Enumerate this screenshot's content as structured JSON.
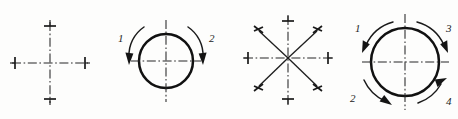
{
  "sheet": {
    "title": "Four mechanical motion-direction figures",
    "background_color": "#fdfdfc",
    "ink_color": "#1a1a1a",
    "width": 458,
    "height": 119,
    "figure_count": 4
  },
  "figures": [
    {
      "id": "figure-1",
      "name": "crosshair-axes",
      "type": "crosshair",
      "description": "Plain crossed centerlines with end ticks, no circle, no arrows",
      "center": {
        "x": 50,
        "y": 63
      },
      "horizontal_span": {
        "x1": 12,
        "x2": 88
      },
      "vertical_span": {
        "y1": 22,
        "y2": 103
      },
      "tick_count": 4,
      "arrow_count": 0,
      "arrows": []
    },
    {
      "id": "figure-2",
      "name": "circle-two-arrows",
      "type": "circle-with-arrows",
      "description": "Circle with crossed centerlines and two downward curved arrows on left and right",
      "center": {
        "x": 166,
        "y": 61
      },
      "radius": 27,
      "arrow_count": 2,
      "arrows": [
        {
          "label": "1",
          "position": "upper-left",
          "direction": "down",
          "sense": "clockwise",
          "label_x": 118,
          "label_y": 39
        },
        {
          "label": "2",
          "position": "upper-right",
          "direction": "down",
          "sense": "counterclockwise",
          "label_x": 210,
          "label_y": 39
        }
      ]
    },
    {
      "id": "figure-3",
      "name": "eight-spoke-star",
      "type": "star-8",
      "description": "Eight radiating spokes: dash-dot horizontal and vertical centerlines plus four solid diagonals, each terminated by a tick mark",
      "center": {
        "x": 288,
        "y": 58
      },
      "spoke_count": 8,
      "arm_length_axis": 44,
      "arm_length_diagonal": 37,
      "arrow_count": 0,
      "arrows": []
    },
    {
      "id": "figure-4",
      "name": "circle-four-arrows",
      "type": "circle-with-arrows",
      "description": "Larger circle with crossed centerlines and four curved arrows at the quadrant corners",
      "center": {
        "x": 405,
        "y": 62
      },
      "radius": 34,
      "arrow_count": 4,
      "arrows": [
        {
          "label": "1",
          "position": "upper-left",
          "direction": "down-left",
          "sense": "counterclockwise",
          "label_x": 357,
          "label_y": 28
        },
        {
          "label": "2",
          "position": "lower-left",
          "direction": "down-right",
          "sense": "clockwise",
          "label_x": 353,
          "label_y": 100
        },
        {
          "label": "3",
          "position": "upper-right",
          "direction": "down-right",
          "sense": "clockwise",
          "label_x": 449,
          "label_y": 28
        },
        {
          "label": "4",
          "position": "lower-right",
          "direction": "up-right",
          "sense": "counterclockwise",
          "label_x": 449,
          "label_y": 102
        }
      ]
    }
  ]
}
